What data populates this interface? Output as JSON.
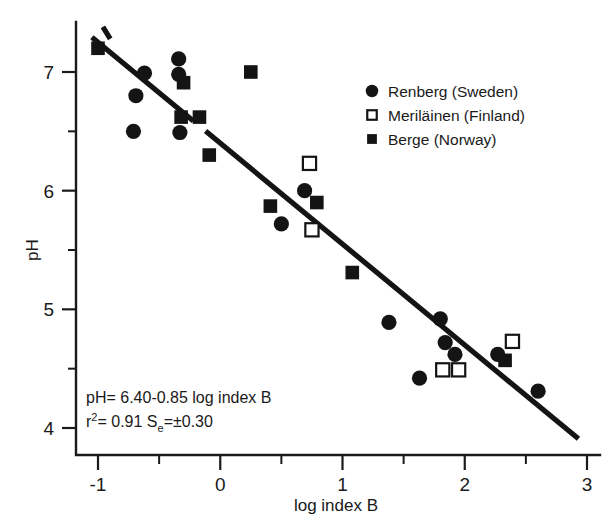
{
  "chart_data": {
    "type": "scatter",
    "title": "",
    "xlabel": "log index B",
    "ylabel": "pH",
    "xlim": [
      -1.25,
      3.1
    ],
    "ylim": [
      3.72,
      7.42
    ],
    "xticks": [
      -1,
      0,
      1,
      2,
      3
    ],
    "xtick_labels": [
      "-1",
      "0",
      "1",
      "2",
      "3"
    ],
    "xminorticks": [
      -0.5,
      0.5,
      1.5,
      2.5
    ],
    "yticks": [
      4,
      5,
      6,
      7
    ],
    "ytick_labels": [
      "4",
      "5",
      "6",
      "7"
    ],
    "yminorticks": [
      4.5,
      5.5,
      6.5
    ],
    "grid": false,
    "legend_position": "upper right",
    "series": [
      {
        "name": "Renberg (Sweden)",
        "marker": "filled-circle",
        "color": "#141414",
        "points": [
          [
            -0.62,
            6.99
          ],
          [
            -0.69,
            6.8
          ],
          [
            -0.34,
            7.11
          ],
          [
            -0.34,
            6.98
          ],
          [
            -0.71,
            6.5
          ],
          [
            -0.33,
            6.49
          ],
          [
            0.69,
            6.0
          ],
          [
            0.5,
            5.72
          ],
          [
            1.38,
            4.89
          ],
          [
            1.8,
            4.92
          ],
          [
            1.84,
            4.72
          ],
          [
            1.92,
            4.62
          ],
          [
            1.63,
            4.42
          ],
          [
            2.27,
            4.62
          ],
          [
            2.6,
            4.31
          ]
        ]
      },
      {
        "name": "Meriläinen (Finland)",
        "marker": "open-square",
        "color": "#141414",
        "points": [
          [
            0.73,
            6.23
          ],
          [
            0.75,
            5.67
          ],
          [
            1.82,
            4.49
          ],
          [
            1.95,
            4.49
          ],
          [
            2.39,
            4.73
          ]
        ]
      },
      {
        "name": "Berge (Norway)",
        "marker": "filled-square",
        "color": "#141414",
        "points": [
          [
            -1.0,
            7.2
          ],
          [
            -0.3,
            6.91
          ],
          [
            -0.32,
            6.62
          ],
          [
            -0.17,
            6.62
          ],
          [
            0.25,
            7.0
          ],
          [
            -0.09,
            6.3
          ],
          [
            0.41,
            5.87
          ],
          [
            0.79,
            5.9
          ],
          [
            1.08,
            5.31
          ],
          [
            2.33,
            4.57
          ]
        ]
      }
    ],
    "fit_line": {
      "slope": -0.85,
      "intercept": 6.4,
      "x_start": -1.05,
      "x_end": 2.93
    },
    "annotations": {
      "equation_line1": "pH= 6.40-0.85 log index B",
      "equation_line2_prefix": "r",
      "equation_line2_sup": "2",
      "equation_line2_mid": "= 0.91 S",
      "equation_line2_sub": "e",
      "equation_line2_suffix": "=±0.30"
    }
  },
  "legend": {
    "entries": [
      {
        "label": "Renberg (Sweden)",
        "marker": "filled-circle"
      },
      {
        "label": "Meriläinen (Finland)",
        "marker": "open-square"
      },
      {
        "label": "Berge (Norway)",
        "marker": "filled-square"
      }
    ]
  },
  "axes": {
    "x_title": "log index B",
    "y_title": "pH"
  }
}
